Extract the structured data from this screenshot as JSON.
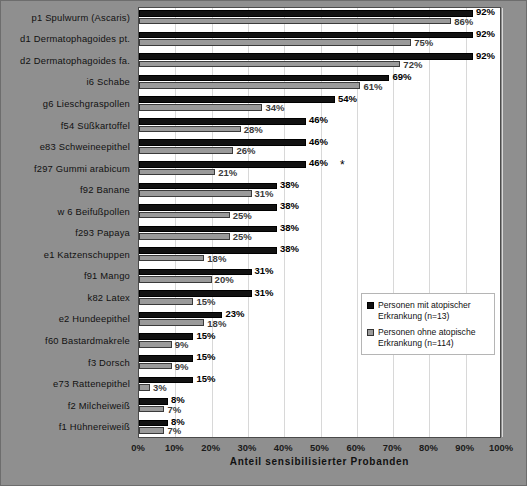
{
  "chart_data": {
    "type": "bar",
    "orientation": "horizontal",
    "title": "",
    "xlabel": "Anteil sensibilisierter Probanden",
    "ylabel": "",
    "xlim": [
      0,
      100
    ],
    "xticks": [
      "0%",
      "10%",
      "20%",
      "30%",
      "40%",
      "50%",
      "60%",
      "70%",
      "80%",
      "90%",
      "100%"
    ],
    "grid": true,
    "legend_position": "inside-right",
    "categories": [
      "p1  Spulwurm (Ascaris)",
      "d1  Dermatophagoides pt.",
      "d2  Dermatophagoides fa.",
      "i6  Schabe",
      "g6  Lieschgraspollen",
      "f54  Süßkartoffel",
      "e83  Schweineepithel",
      "f297  Gummi arabicum",
      "f92  Banane",
      "w 6 Beifußpollen",
      "f293  Papaya",
      "e1 Katzenschuppen",
      "f91  Mango",
      "k82  Latex",
      "e2  Hundeepithel",
      "f60 Bastardmakrele",
      "f3  Dorsch",
      "e73  Rattenepithel",
      "f2  Milcheiweiß",
      "f1  Hühnereiweiß"
    ],
    "series": [
      {
        "name": "Personen mit atopischer Erkrankung (n=13)",
        "color": "#121212",
        "values": [
          92,
          92,
          92,
          69,
          54,
          46,
          46,
          46,
          38,
          38,
          38,
          38,
          31,
          31,
          23,
          15,
          15,
          15,
          8,
          8
        ],
        "labels": [
          "92%",
          "92%",
          "92%",
          "69%",
          "54%",
          "46%",
          "46%",
          "46%",
          "38%",
          "38%",
          "38%",
          "38%",
          "31%",
          "31%",
          "23%",
          "15%",
          "15%",
          "15%",
          "8%",
          "8%"
        ]
      },
      {
        "name": "Personen ohne atopische Erkrankung (n=114)",
        "color": "#9a9a9a",
        "values": [
          86,
          75,
          72,
          61,
          34,
          28,
          26,
          21,
          31,
          25,
          25,
          18,
          20,
          15,
          18,
          9,
          9,
          3,
          7,
          7
        ],
        "labels": [
          "86%",
          "75%",
          "72%",
          "61%",
          "34%",
          "28%",
          "26%",
          "21%",
          "31%",
          "25%",
          "25%",
          "18%",
          "20%",
          "15%",
          "18%",
          "9%",
          "9%",
          "3%",
          "7%",
          "7%"
        ]
      }
    ],
    "annotations": [
      {
        "category_index": 7,
        "text": "*"
      }
    ]
  },
  "legend": {
    "items": [
      {
        "label": "Personen mit atopischer Erkrankung (n=13)",
        "swatch": "atopic"
      },
      {
        "label": "Personen ohne atopische Erkrankung (n=114)",
        "swatch": "nonatopic"
      }
    ]
  },
  "axis": {
    "x_title": "Anteil sensibilisierter Probanden"
  }
}
